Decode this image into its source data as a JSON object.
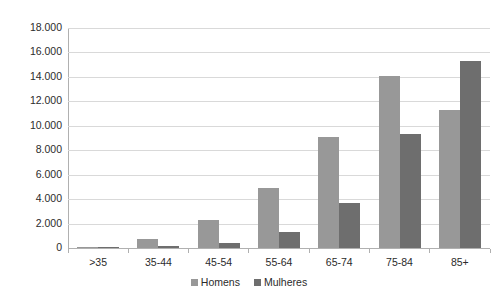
{
  "chart_data": {
    "type": "bar",
    "title": "",
    "subtitle": "",
    "xlabel": "",
    "ylabel": "",
    "categories": [
      ">35",
      "35-44",
      "45-54",
      "55-64",
      "65-74",
      "75-84",
      "85+"
    ],
    "series": [
      {
        "name": "Homens",
        "color": "#989898",
        "values": [
          110,
          700,
          2300,
          4900,
          9100,
          14050,
          11300
        ]
      },
      {
        "name": "Mulheres",
        "color": "#6e6e6e",
        "values": [
          40,
          150,
          450,
          1300,
          3700,
          9350,
          15300
        ]
      }
    ],
    "ylim": [
      0,
      18000
    ],
    "ytick_step": 2000,
    "ytick_labels": [
      "18.000",
      "16.000",
      "14.000",
      "12.000",
      "10.000",
      "8.000",
      "6.000",
      "4.000",
      "2.000",
      "0"
    ],
    "ytick_values": [
      18000,
      16000,
      14000,
      12000,
      10000,
      8000,
      6000,
      4000,
      2000,
      0
    ],
    "grid": true,
    "grid_axis": "y",
    "legend_position": "bottom",
    "legend_entries": [
      "Homens",
      "Mulheres"
    ],
    "annotations": [],
    "background_color": "#ffffff",
    "gridline_color": "#d9d9d9",
    "axis_color": "#b0b0b0"
  }
}
